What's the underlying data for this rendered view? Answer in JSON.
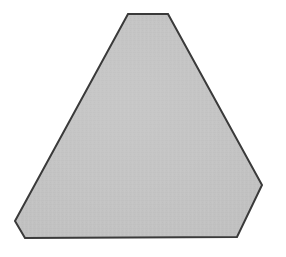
{
  "figure": {
    "name": "truncated-triangle",
    "alt_text": "Gray shaded hexagonal figure resembling a triangle with truncated corners",
    "background_color": "#ffffff",
    "fill_color": "#c0c0c0",
    "fill_color_light": "#c8c8c8",
    "fill_color_dark": "#b6b6b6",
    "stroke_color": "#3a3a3a",
    "stroke_width": 2,
    "texture": "scanned paper grain",
    "canvas": {
      "width": 286,
      "height": 257
    },
    "polygon_points": "128,14 168,14 262,185 237,237 25,238 15,221",
    "vertices": [
      {
        "label": "apex-left",
        "x": 128,
        "y": 14
      },
      {
        "label": "apex-right",
        "x": 168,
        "y": 14
      },
      {
        "label": "right",
        "x": 262,
        "y": 185
      },
      {
        "label": "bottom-right",
        "x": 237,
        "y": 237
      },
      {
        "label": "bottom-left",
        "x": 25,
        "y": 238
      },
      {
        "label": "left",
        "x": 15,
        "y": 221
      }
    ],
    "edges": [
      {
        "label": "top-truncation",
        "from": "apex-left",
        "to": "apex-right"
      },
      {
        "label": "right-slant",
        "from": "apex-right",
        "to": "right"
      },
      {
        "label": "right-truncation",
        "from": "right",
        "to": "bottom-right"
      },
      {
        "label": "base",
        "from": "bottom-right",
        "to": "bottom-left"
      },
      {
        "label": "left-truncation",
        "from": "bottom-left",
        "to": "left"
      },
      {
        "label": "left-slant",
        "from": "left",
        "to": "apex-left"
      }
    ],
    "side_count": 6
  }
}
